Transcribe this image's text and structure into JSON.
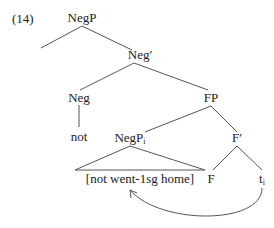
{
  "example_number": "(14)",
  "nodes": {
    "negp": "NegP",
    "negbar": "Neg′",
    "neg": "Neg",
    "fp": "FP",
    "not": "not",
    "negpi": "NegP",
    "negpi_sub": "i",
    "fbar": "F′",
    "bracket": "[not went-1sg home]",
    "f": "F",
    "t": "t",
    "t_sub": "i"
  }
}
